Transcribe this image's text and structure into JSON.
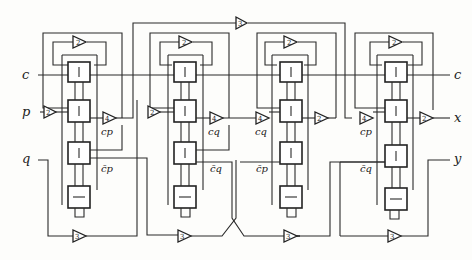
{
  "diagram": {
    "type": "systolic processor array (4 cells)",
    "inputs": [
      {
        "id": "c_in",
        "label": "c"
      },
      {
        "id": "p_in",
        "label": "p"
      },
      {
        "id": "q_in",
        "label": "q"
      }
    ],
    "outputs": [
      {
        "id": "c_out",
        "label": "c"
      },
      {
        "id": "x_out",
        "label": "x"
      },
      {
        "id": "y_out",
        "label": "y"
      }
    ],
    "cells": [
      {
        "id": "cell1",
        "top_amp": "2",
        "mid_in_amp": "2",
        "mid_out_amp": "4",
        "mid_out_label": "cp",
        "lower_out_label": "c̄p",
        "bottom_amp": "3"
      },
      {
        "id": "cell2",
        "top_amp": "2",
        "mid_in_amp": "2",
        "mid_out_amp": "4",
        "mid_out_label": "cq",
        "lower_out_label": "c̄q",
        "bottom_amp": "3"
      },
      {
        "id": "cell3",
        "top_amp": "2",
        "mid_in_amp": "4",
        "mid_in_label": "cq",
        "mid_out_amp": "2",
        "lower_in_label": "c̄p",
        "bottom_amp": "3"
      },
      {
        "id": "cell4",
        "top_amp": "2",
        "mid_in_amp": "4",
        "mid_in_label": "cp",
        "mid_out_amp": "2",
        "lower_in_label": "c̄q",
        "bottom_amp": "3"
      }
    ],
    "top_bus_amp": "3",
    "amp_labels": {
      "two": "2",
      "three": "3",
      "four": "4"
    },
    "labels": {
      "c_in": "c",
      "p_in": "p",
      "q_in": "q",
      "c_out": "c",
      "x_out": "x",
      "y_out": "y",
      "cp1": "cp",
      "cbarp1": "c̄p",
      "cq2": "cq",
      "cbarq2": "c̄q",
      "cq3": "cq",
      "cbarp3": "c̄p",
      "cp4": "cp",
      "cbarq4": "c̄q"
    }
  }
}
